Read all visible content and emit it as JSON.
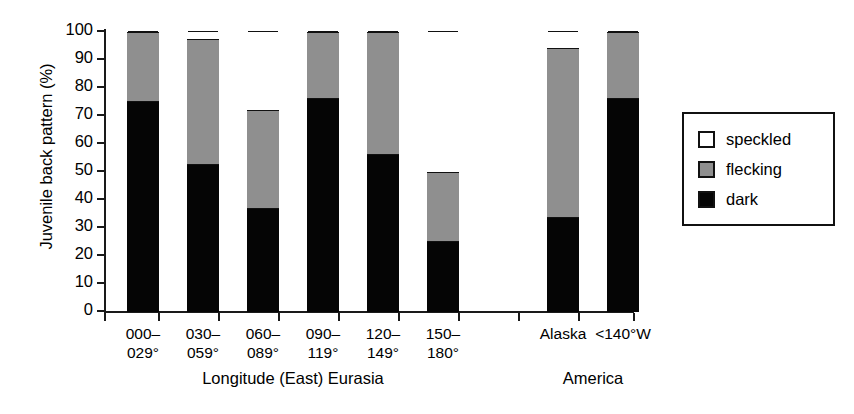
{
  "chart_data": {
    "type": "bar",
    "subtype": "stacked-percentage",
    "title": "",
    "xlabel": "",
    "ylabel": "Juvenile back pattern (%)",
    "ylim": [
      0,
      100
    ],
    "yticks": [
      0,
      10,
      20,
      30,
      40,
      50,
      60,
      70,
      80,
      90,
      100
    ],
    "ytick_labels": [
      "0",
      "10",
      "20",
      "30",
      "40",
      "50",
      "60",
      "70",
      "80",
      "90",
      "100"
    ],
    "grid": false,
    "legend_position": "right",
    "categories": [
      "000–\n029°",
      "030–\n059°",
      "060–\n089°",
      "090–\n119°",
      "120–\n149°",
      "150–\n180°",
      "Alaska",
      "<140°W"
    ],
    "group_labels": [
      "Longitude (East) Eurasia",
      "America"
    ],
    "series": [
      {
        "name": "dark",
        "color": "#050505",
        "values": [
          75,
          52.5,
          36.5,
          76,
          56,
          25,
          33.5,
          76
        ]
      },
      {
        "name": "flecking",
        "color": "#8f8f8f",
        "values": [
          25,
          45,
          35.5,
          24,
          44,
          25,
          60.5,
          24
        ]
      },
      {
        "name": "speckled",
        "color": "#ffffff",
        "values": [
          0,
          2.5,
          28,
          0,
          0,
          50,
          6,
          0
        ]
      }
    ],
    "legend_entries": [
      {
        "label": "speckled",
        "color": "#ffffff"
      },
      {
        "label": "flecking",
        "color": "#8f8f8f"
      },
      {
        "label": "dark",
        "color": "#050505"
      }
    ]
  }
}
